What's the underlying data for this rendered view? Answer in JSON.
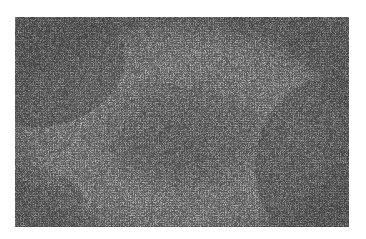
{
  "image": {
    "subject": "grayscale histology micrograph",
    "description": "Tissue section showing a pale circular zone surrounding a darker dense central nodule, with dense dark cellular areas at the corners",
    "palette": {
      "dark_region": "#4a4a4a",
      "light_region": "#b4b4b4",
      "center_region": "#808080",
      "background": "#ffffff"
    }
  }
}
